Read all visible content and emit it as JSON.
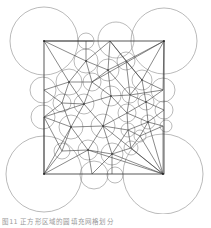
{
  "figure": {
    "caption": "图11 正方形区域的圆填充网格划分",
    "colors": {
      "circle": "#8c8c8c",
      "edge": "#3a3a3a",
      "frame": "#2f2f2f",
      "background": "#ffffff"
    },
    "square": {
      "x": 44,
      "y": 41,
      "width": 120,
      "height": 133
    },
    "corner_circles": [
      {
        "cx": 44,
        "cy": 41,
        "r": 34
      },
      {
        "cx": 164,
        "cy": 41,
        "r": 33
      },
      {
        "cx": 44,
        "cy": 174,
        "r": 38
      },
      {
        "cx": 163,
        "cy": 174,
        "r": 40
      }
    ]
  }
}
